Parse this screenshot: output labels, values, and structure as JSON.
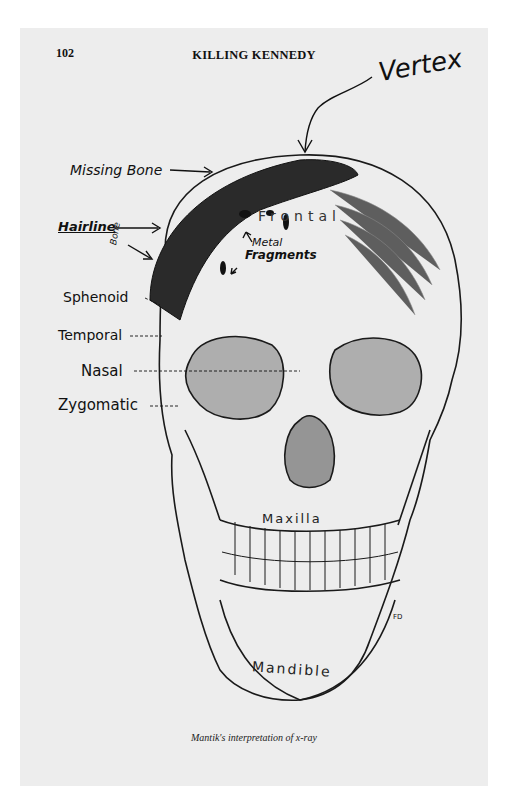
{
  "header": {
    "page_number": "102",
    "running_head": "KILLING KENNEDY"
  },
  "annotations": {
    "vertex": "Vertex",
    "missing_bone": "Missing Bone",
    "hairline": "Hairline",
    "bone": "Bone",
    "metal": "Metal",
    "fragments": "Fragments"
  },
  "labels": {
    "sphenoid": "Sphenoid",
    "temporal": "Temporal",
    "nasal": "Nasal",
    "zygomatic": "Zygomatic",
    "frontal": "Frontal",
    "maxilla": "Maxilla",
    "mandible": "Mandible",
    "artist_mark": "FD"
  },
  "caption": "Mantik's interpretation of x-ray",
  "colors": {
    "paper": "#ededed",
    "ink": "#111111",
    "shaded_region": "#2a2a2a"
  }
}
